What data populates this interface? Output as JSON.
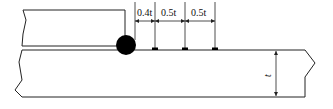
{
  "diagram": {
    "type": "weld-measurement-points",
    "colors": {
      "line": "#222222",
      "weld": "#000000",
      "background": "#ffffff"
    },
    "dimensions": [
      {
        "id": "d1",
        "label": "0.4t"
      },
      {
        "id": "d2",
        "label": "0.5t"
      },
      {
        "id": "d3",
        "label": "0.5t"
      }
    ],
    "thickness_label": "t"
  }
}
